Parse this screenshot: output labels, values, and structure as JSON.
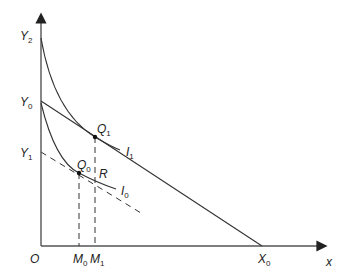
{
  "diagram": {
    "axes": {
      "x_label": "x",
      "origin_label": "O"
    },
    "labels": {
      "Y2": {
        "main": "Y",
        "sub": "2"
      },
      "Y0": {
        "main": "Y",
        "sub": "0"
      },
      "Y1": {
        "main": "Y",
        "sub": "1"
      },
      "Q1": {
        "main": "Q",
        "sub": "1"
      },
      "Q0": {
        "main": "Q",
        "sub": "0"
      },
      "R": {
        "main": "R",
        "sub": ""
      },
      "I1": {
        "main": "I",
        "sub": "1"
      },
      "I0": {
        "main": "I",
        "sub": "0"
      },
      "M0": {
        "main": "M",
        "sub": "0"
      },
      "M1": {
        "main": "M",
        "sub": "1"
      },
      "X0": {
        "main": "X",
        "sub": "0"
      }
    },
    "colors": {
      "line": "#333333",
      "axis": "#666666"
    }
  }
}
